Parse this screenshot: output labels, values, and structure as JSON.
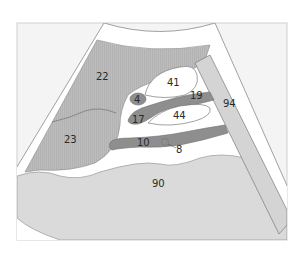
{
  "diagram": {
    "type": "ultrasound-sector-schematic",
    "colors": {
      "frame_bg": "#f4f4f4",
      "frame_border": "#cfcfcf",
      "hatched_gray": "#b9b9b9",
      "light_gray": "#dadada",
      "dark_gray": "#8e8e8e",
      "white": "#ffffff",
      "outline": "#7a7a7a"
    },
    "labels": [
      {
        "id": "22",
        "text": "22"
      },
      {
        "id": "23",
        "text": "23"
      },
      {
        "id": "4",
        "text": "4"
      },
      {
        "id": "17",
        "text": "17"
      },
      {
        "id": "41",
        "text": "41"
      },
      {
        "id": "19",
        "text": "19"
      },
      {
        "id": "44",
        "text": "44"
      },
      {
        "id": "10",
        "text": "10"
      },
      {
        "id": "8",
        "text": "8"
      },
      {
        "id": "94",
        "text": "94"
      },
      {
        "id": "90",
        "text": "90"
      }
    ]
  }
}
